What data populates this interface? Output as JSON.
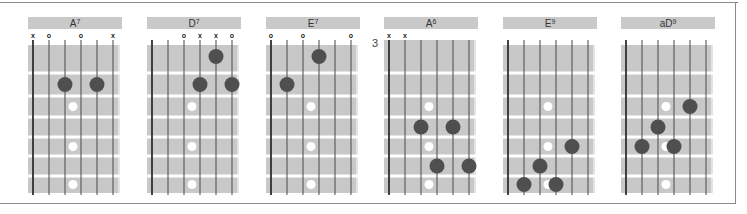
{
  "diagram": {
    "type": "guitar-chord-chart",
    "strings": 6,
    "colors": {
      "fretboard": "#c8c8c8",
      "fret_line": "#ffffff",
      "string": "#555555",
      "finger_dot": "#4f4f4f",
      "inlay_dot": "#ffffff",
      "header": "#c9c9c9",
      "frame": "#8a8a8a"
    },
    "inlay_frets": [
      3,
      5,
      7
    ],
    "chords": [
      {
        "name": "A",
        "superscript": "7",
        "start_fret_label": "",
        "markers": [
          "x",
          "o",
          "",
          "o",
          "",
          "x"
        ],
        "fingers": [
          {
            "string": 3,
            "fret": 2
          },
          {
            "string": 5,
            "fret": 2
          }
        ]
      },
      {
        "name": "D",
        "superscript": "7",
        "start_fret_label": "",
        "markers": [
          "",
          "",
          "o",
          "x",
          "x",
          "o"
        ],
        "fingers": [
          {
            "string": 5,
            "fret": 1
          },
          {
            "string": 4,
            "fret": 2
          },
          {
            "string": 6,
            "fret": 2
          }
        ]
      },
      {
        "name": "E",
        "superscript": "7",
        "start_fret_label": "",
        "markers": [
          "o",
          "",
          "o",
          "",
          "",
          "o"
        ],
        "fingers": [
          {
            "string": 4,
            "fret": 1
          },
          {
            "string": 2,
            "fret": 2
          }
        ]
      },
      {
        "name": "A",
        "superscript": "6",
        "start_fret_label": "3",
        "markers": [
          "x",
          "x",
          "",
          "",
          "",
          ""
        ],
        "fingers": [
          {
            "string": 3,
            "fret": 4
          },
          {
            "string": 5,
            "fret": 4
          },
          {
            "string": 4,
            "fret": 6
          },
          {
            "string": 6,
            "fret": 6
          }
        ]
      },
      {
        "name": "E",
        "superscript": "9",
        "start_fret_label": "",
        "markers": [
          "",
          "",
          "",
          "",
          "",
          ""
        ],
        "fingers": [
          {
            "string": 5,
            "fret": 5
          },
          {
            "string": 3,
            "fret": 6
          },
          {
            "string": 2,
            "fret": 7
          },
          {
            "string": 4,
            "fret": 7
          }
        ]
      },
      {
        "name": "aD",
        "superscript": "9",
        "start_fret_label": "",
        "markers": [
          "",
          "",
          "",
          "",
          "",
          ""
        ],
        "fingers": [
          {
            "string": 5,
            "fret": 3
          },
          {
            "string": 3,
            "fret": 4
          },
          {
            "string": 2,
            "fret": 5
          },
          {
            "string": 4,
            "fret": 5
          }
        ]
      }
    ]
  }
}
